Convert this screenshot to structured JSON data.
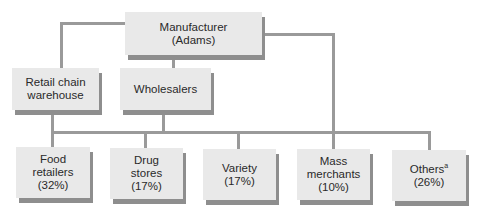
{
  "diagram": {
    "manufacturer": {
      "label": "Manufacturer\n(Adams)"
    },
    "intermediaries": [
      {
        "label": "Retail chain\nwarehouse"
      },
      {
        "label": "Wholesalers"
      }
    ],
    "retailers": [
      {
        "name": "Food\nretailers",
        "share": "(32%)"
      },
      {
        "name": "Drug\nstores",
        "share": "(17%)"
      },
      {
        "name": "Variety",
        "share": "(17%)"
      },
      {
        "name": "Mass\nmerchants",
        "share": "(10%)"
      },
      {
        "name": "Others",
        "footnote_mark": "a",
        "share": "(26%)"
      }
    ]
  }
}
